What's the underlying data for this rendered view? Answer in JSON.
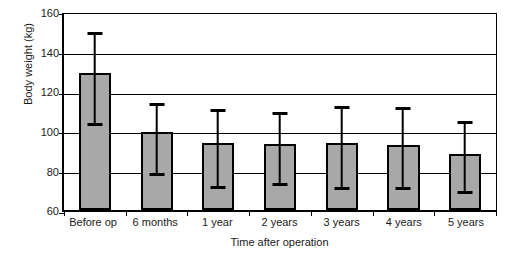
{
  "chart_data": {
    "type": "bar",
    "title": "",
    "xlabel": "Time after operation",
    "ylabel": "Body weight (kg)",
    "categories": [
      "Before op",
      "6 months",
      "1 year",
      "2 years",
      "3 years",
      "4 years",
      "5 years"
    ],
    "values": [
      129,
      99,
      93.5,
      93,
      93.5,
      92.5,
      88
    ],
    "error_upper": [
      151,
      115.5,
      112.5,
      111,
      114,
      113.5,
      106
    ],
    "error_lower": [
      105,
      80,
      73.5,
      75,
      73,
      73,
      71
    ],
    "ylim": [
      60,
      160
    ],
    "yticks": [
      160,
      140,
      120,
      100,
      80,
      60
    ],
    "ytick_labels": [
      "160",
      "140",
      "120",
      "100",
      "80",
      "60"
    ],
    "grid": true,
    "legend": "none",
    "bar_color": "#a8a8a8",
    "line_color": "#000000"
  },
  "axes": {
    "y_title": "Body weight (kg)",
    "x_title": "Time after operation"
  }
}
